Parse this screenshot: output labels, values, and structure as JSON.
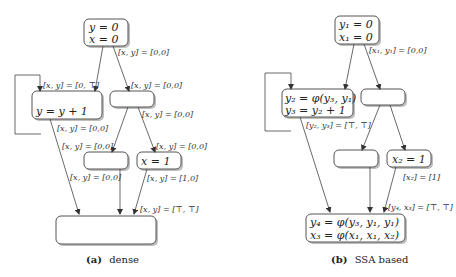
{
  "dense": {
    "caption_label": "(a)",
    "caption_text": "dense",
    "nodes": {
      "entry_line1": "y = 0",
      "entry_line2": "x = 0",
      "loop_body": "y = y + 1",
      "x_assign": "x = 1"
    },
    "edges": {
      "entry_right": "[x, y] = [0,0]",
      "loop_in": "[x, y] = [0, ⊤]",
      "right_in": "[x, y] = [0,0]",
      "right_out": "[x, y] = [0,0]",
      "loop_out": "[x, y] = [0,0]",
      "mid_left_in": "[x, y] = [0,0]",
      "mid_right_in": "[x, y] = [0,0]",
      "mid_left_out": "[x, y] = [0,0]",
      "x_assign_out": "[x, y] = [1,0]",
      "exit_in": "[x, y] = [⊤, ⊤]"
    }
  },
  "ssa": {
    "caption_label": "(b)",
    "caption_text": "SSA based",
    "nodes": {
      "entry_line1": "y₁ = 0",
      "entry_line2": "x₁ = 0",
      "loop_line1": "y₂ = φ(y₃, y₁)",
      "loop_line2": "y₃ = y₂ + 1",
      "x_assign": "x₂ = 1",
      "exit_line1": "y₄ = φ(y₃, y₁, y₁)",
      "exit_line2": "x₃ = φ(x₁, x₁, x₂)"
    },
    "edges": {
      "entry_right": "[x₁, y₁] = [0,0]",
      "loop_out": "[y₂, y₃] = [⊤, ⊤]",
      "x_assign_out": "[x₂] = [1]",
      "exit_in": "[y₄, x₃] = [⊤, ⊤]"
    }
  },
  "colors": {
    "node_stroke": "#555555",
    "edge": "#444444",
    "shadow": "#bdbdbd"
  }
}
